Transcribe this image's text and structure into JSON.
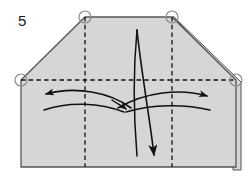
{
  "figure": {
    "kind": "origami-fold-diagram",
    "step_number": "5",
    "caption": "",
    "canvas": {
      "width": 252,
      "height": 180
    }
  },
  "colors": {
    "paper_fill": "#d6d6d6",
    "paper_edge": "#555555",
    "crease_line": "#111111",
    "arrow": "#111111",
    "circle_marker_stroke": "#8a8a8a",
    "background": "#ffffff",
    "step_number": "#1a1a1a"
  },
  "paper": {
    "name": "folded-paper-shape",
    "description": "pentagon-like sheet: flat bottom, vertical left and right sides, two clipped top corners, flat top between them",
    "outline_points": "21,80 85,17 172,17 236,80 236,167 21,167",
    "layer_edge_right": "240,82 240,169",
    "layer_edge_diagonal": "173,16 240,82"
  },
  "creases": [
    {
      "name": "horizontal-crease",
      "type": "dashed",
      "d": "M 21,80 L 236,80"
    },
    {
      "name": "vertical-crease-left",
      "type": "dashed",
      "d": "M 85,17 L 85,167"
    },
    {
      "name": "vertical-crease-right",
      "type": "dashed",
      "d": "M 172,17 L 172,167"
    }
  ],
  "markers": [
    {
      "name": "corner-marker-top-left",
      "cx": 85,
      "cy": 17,
      "r": 6
    },
    {
      "name": "corner-marker-top-right",
      "cx": 172,
      "cy": 17,
      "r": 6
    },
    {
      "name": "corner-marker-left",
      "cx": 21,
      "cy": 80,
      "r": 6
    },
    {
      "name": "corner-marker-right",
      "cx": 236,
      "cy": 80,
      "r": 6
    }
  ],
  "arrows": [
    {
      "name": "arrow-spread-left",
      "direction": "left",
      "d": "M 131,108 C 110,92 75,86 45,94",
      "head_at": [
        43,
        94
      ],
      "head_angle": -170
    },
    {
      "name": "arrow-spread-right",
      "direction": "right",
      "d": "M 118,108 C 145,92 180,88 208,96",
      "head_at": [
        210,
        96
      ],
      "head_angle": 16
    },
    {
      "name": "arrow-sweep-lower-left",
      "direction": "left-tail",
      "d": "M 124,112 C 100,103 70,101 44,110",
      "head_at": null,
      "head_angle": null
    },
    {
      "name": "arrow-sweep-lower-right",
      "direction": "right-tail",
      "d": "M 126,112 C 152,104 185,104 210,110",
      "head_at": null,
      "head_angle": null
    },
    {
      "name": "arrow-center-converge",
      "direction": "center",
      "d": "M 112,100 C 118,105 122,107 127,109",
      "head_at": [
        128,
        110
      ],
      "head_angle": 28
    },
    {
      "name": "arrow-fold-down-main",
      "direction": "down",
      "d": "M 137,30 C 141,70 150,120 155,157",
      "head_at": [
        156,
        160
      ],
      "head_angle": 82
    },
    {
      "name": "arrow-fold-down-companion",
      "direction": "down",
      "d": "M 137,30 C 133,72 134,120 137,156",
      "head_at": null,
      "head_angle": null
    }
  ],
  "labels": {
    "step_number_position": {
      "x": 18,
      "y": 26
    }
  }
}
